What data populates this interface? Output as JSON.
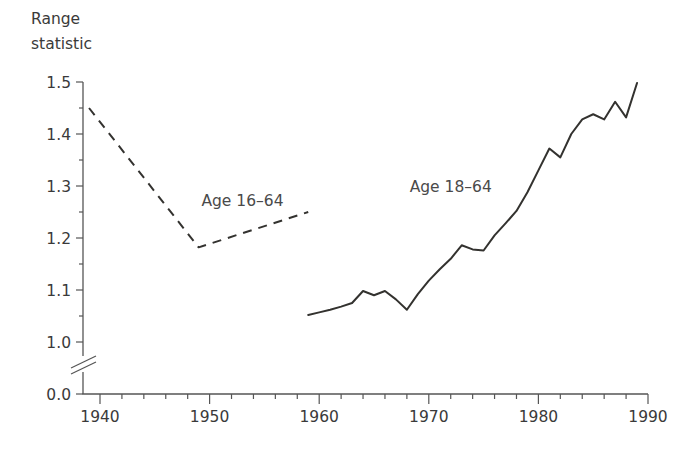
{
  "chart_data": {
    "type": "line",
    "title": "Range statistic",
    "xlabel": "",
    "ylabel": "Range statistic",
    "xlim": [
      1938,
      1990
    ],
    "ylim": [
      1.0,
      1.5
    ],
    "y_break": true,
    "y_break_base": 0.0,
    "grid": false,
    "legend_position": "inline-annotations",
    "ytick_labels": [
      "0.0",
      "1.0",
      "1.1",
      "1.2",
      "1.3",
      "1.4",
      "1.5"
    ],
    "ytick_values": [
      0.0,
      1.0,
      1.1,
      1.2,
      1.3,
      1.4,
      1.5
    ],
    "xtick_labels": [
      "1940",
      "1950",
      "1960",
      "1970",
      "1980",
      "1990"
    ],
    "xtick_values": [
      1940,
      1950,
      1960,
      1970,
      1980,
      1990
    ],
    "x_minor_step": 2,
    "series": [
      {
        "name": "Age 16-64",
        "style": "dashed",
        "label_text": "Age 16–64",
        "label_x": 1953,
        "label_y": 1.262,
        "x": [
          1939,
          1949,
          1959
        ],
        "values": [
          1.45,
          1.182,
          1.25
        ]
      },
      {
        "name": "Age 18-64",
        "style": "solid",
        "label_text": "Age 18–64",
        "label_x": 1972,
        "label_y": 1.288,
        "x": [
          1959,
          1960,
          1961,
          1962,
          1963,
          1964,
          1965,
          1966,
          1967,
          1968,
          1969,
          1970,
          1971,
          1972,
          1973,
          1974,
          1975,
          1976,
          1977,
          1978,
          1979,
          1980,
          1981,
          1982,
          1983,
          1984,
          1985,
          1986,
          1987,
          1988,
          1989
        ],
        "values": [
          1.052,
          1.057,
          1.062,
          1.068,
          1.075,
          1.098,
          1.09,
          1.098,
          1.082,
          1.062,
          1.092,
          1.118,
          1.14,
          1.16,
          1.186,
          1.178,
          1.176,
          1.205,
          1.228,
          1.252,
          1.288,
          1.33,
          1.372,
          1.355,
          1.4,
          1.428,
          1.438,
          1.428,
          1.462,
          1.432,
          1.498
        ]
      }
    ]
  },
  "axis_title": {
    "line1": "Range",
    "line2": "statistic"
  }
}
